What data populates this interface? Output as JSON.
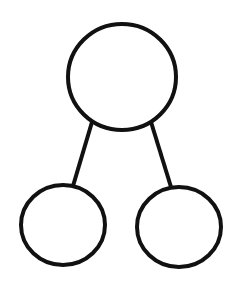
{
  "diagram": {
    "type": "tree",
    "width": 234,
    "height": 286,
    "background": "#ffffff",
    "stroke_color": "#111111",
    "stroke_width": 4,
    "nodes": [
      {
        "id": "root",
        "cx": 122,
        "cy": 77,
        "rx": 54,
        "ry": 53,
        "label": ""
      },
      {
        "id": "left-child",
        "cx": 63,
        "cy": 225,
        "rx": 42,
        "ry": 40,
        "label": ""
      },
      {
        "id": "right-child",
        "cx": 179,
        "cy": 227,
        "rx": 42,
        "ry": 40,
        "label": ""
      }
    ],
    "edges": [
      {
        "from": "root",
        "to": "left-child",
        "x1": 92,
        "y1": 122,
        "x2": 73,
        "y2": 186
      },
      {
        "from": "root",
        "to": "right-child",
        "x1": 151,
        "y1": 122,
        "x2": 171,
        "y2": 187
      }
    ]
  }
}
